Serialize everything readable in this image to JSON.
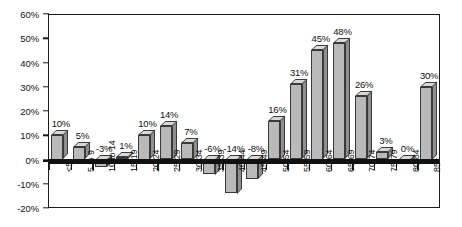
{
  "chart_data": {
    "type": "bar",
    "title": "",
    "subtitle": "",
    "xlabel": "",
    "ylabel": "",
    "ylim": [
      -20,
      60
    ],
    "ytick_step": 10,
    "grid": false,
    "legend": false,
    "value_suffix": "%",
    "categories": [
      "<5",
      "5 to 9",
      "10 to 14",
      "15-19",
      "20-24",
      "25-29",
      "30-34",
      "35-39",
      "40-44",
      "45-49",
      "50-54",
      "55-59",
      "60-64",
      "65-69",
      "70-74",
      "75-79",
      "80-84",
      "85+"
    ],
    "values": [
      10,
      5,
      -3,
      1,
      10,
      14,
      7,
      -6,
      -14,
      -8,
      16,
      31,
      45,
      48,
      26,
      3,
      0,
      30
    ],
    "data_labels": [
      "10%",
      "5%",
      "-3%",
      "1%",
      "10%",
      "14%",
      "7%",
      "-6%",
      "-14%",
      "-8%",
      "16%",
      "31%",
      "45%",
      "48%",
      "26%",
      "3%",
      "0%",
      "30%"
    ],
    "ytick_labels": [
      "60%",
      "50%",
      "40%",
      "30%",
      "20%",
      "10%",
      "0%",
      "-10%",
      "-20%"
    ],
    "ytick_values": [
      60,
      50,
      40,
      30,
      20,
      10,
      0,
      -10,
      -20
    ],
    "colors": {
      "bar_front": "#b9b9b9",
      "bar_top": "#d8d8d8",
      "bar_side": "#8f8f8f",
      "axis": "#1a1a1a",
      "baseline": "#111111",
      "text": "#111111",
      "background": "#ffffff"
    }
  }
}
